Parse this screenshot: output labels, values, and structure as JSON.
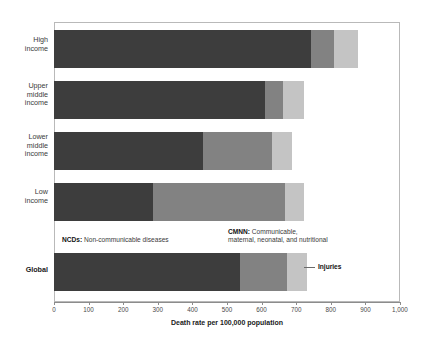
{
  "chart_data": {
    "type": "bar",
    "orientation": "horizontal",
    "stacked": true,
    "title": "",
    "xlabel": "Death rate per 100,000 population",
    "ylabel": "",
    "xlim": [
      0,
      1000
    ],
    "grid": false,
    "legend_position": "inline-annotations",
    "categories": [
      "High income",
      "Upper middle income",
      "Lower middle income",
      "Low income",
      "Global"
    ],
    "series": [
      {
        "name": "NCDs",
        "values": [
          743,
          609,
          430,
          286,
          537
        ]
      },
      {
        "name": "CMNN",
        "values": [
          66,
          52,
          199,
          381,
          135
        ]
      },
      {
        "name": "Injuries",
        "values": [
          69,
          63,
          58,
          57,
          58
        ]
      }
    ],
    "totals": [
      878,
      724,
      687,
      724,
      730
    ],
    "tick_labels": [
      "0",
      "100",
      "200",
      "300",
      "400",
      "500",
      "600",
      "700",
      "800",
      "900",
      "1,000"
    ],
    "tick_values": [
      0,
      100,
      200,
      300,
      400,
      500,
      600,
      700,
      800,
      900,
      1000
    ],
    "colors": {
      "ncds": "#3d3d3d",
      "cmnn": "#828282",
      "injuries": "#c4c4c4",
      "axis": "#8c8c8c",
      "frame": "#b9b9b9",
      "text": "#231f20"
    }
  },
  "axis": {
    "x_title": "Death rate per 100,000 population"
  },
  "categories": [
    {
      "label": "High\nincome",
      "bold": false
    },
    {
      "label": "Upper\nmiddle\nincome",
      "bold": false
    },
    {
      "label": "Lower\nmiddle\nincome",
      "bold": false
    },
    {
      "label": "Low\nincome",
      "bold": false
    },
    {
      "label": "Global",
      "bold": true
    }
  ],
  "annotations": {
    "ncds_bold": "NCDs:",
    "ncds_rest": " Non-communicable diseases",
    "cmnn_bold": "CMNN:",
    "cmnn_rest": " Communicable,\nmaternal, neonatal, and nutritional",
    "injuries": "Injuries"
  }
}
